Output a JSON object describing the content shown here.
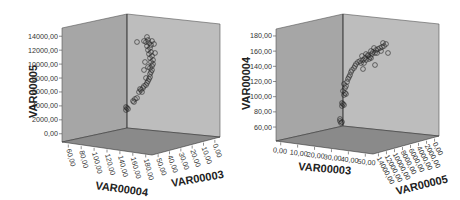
{
  "chart_data": [
    {
      "type": "scatter",
      "subtype": "3d-scatter",
      "title": "",
      "axes": {
        "vertical": {
          "label": "VAR00005",
          "ticks": [
            "0,00",
            "2000,00",
            "4000,00",
            "6000,00",
            "8000,00",
            "10000,00",
            "12000,00",
            "14000,00"
          ],
          "range": [
            0,
            14000
          ]
        },
        "left_depth": {
          "label": "VAR00004",
          "ticks": [
            "60,00",
            "80,00",
            "100,00",
            "120,00",
            "140,00",
            "160,00",
            "180,00"
          ],
          "range": [
            60,
            180
          ]
        },
        "right_depth": {
          "label": "VAR00003",
          "ticks": [
            "50,00",
            "40,00",
            "30,00",
            "20,00",
            "10,00",
            "0,00"
          ],
          "range": [
            0,
            50
          ]
        }
      },
      "grid": false,
      "legend": null,
      "points_description": "Curved band of circle markers rising from ~4000 to ~13500 on VAR00005, near the back corner",
      "points": [
        {
          "x": 126,
          "y": 110
        },
        {
          "x": 127,
          "y": 108
        },
        {
          "x": 128,
          "y": 109
        },
        {
          "x": 126,
          "y": 107
        },
        {
          "x": 133,
          "y": 101
        },
        {
          "x": 135,
          "y": 99
        },
        {
          "x": 134,
          "y": 102
        },
        {
          "x": 137,
          "y": 98
        },
        {
          "x": 139,
          "y": 92
        },
        {
          "x": 141,
          "y": 90
        },
        {
          "x": 142,
          "y": 92
        },
        {
          "x": 143,
          "y": 88
        },
        {
          "x": 144,
          "y": 86
        },
        {
          "x": 146,
          "y": 85
        },
        {
          "x": 147,
          "y": 83
        },
        {
          "x": 148,
          "y": 81
        },
        {
          "x": 149,
          "y": 79
        },
        {
          "x": 150,
          "y": 77
        },
        {
          "x": 150,
          "y": 74
        },
        {
          "x": 151,
          "y": 72
        },
        {
          "x": 152,
          "y": 70
        },
        {
          "x": 150,
          "y": 68
        },
        {
          "x": 152,
          "y": 66
        },
        {
          "x": 153,
          "y": 64
        },
        {
          "x": 151,
          "y": 62
        },
        {
          "x": 153,
          "y": 60
        },
        {
          "x": 150,
          "y": 58
        },
        {
          "x": 152,
          "y": 56
        },
        {
          "x": 149,
          "y": 54
        },
        {
          "x": 151,
          "y": 52
        },
        {
          "x": 148,
          "y": 50
        },
        {
          "x": 150,
          "y": 48
        },
        {
          "x": 147,
          "y": 46
        },
        {
          "x": 151,
          "y": 45
        },
        {
          "x": 149,
          "y": 43
        },
        {
          "x": 146,
          "y": 42
        },
        {
          "x": 152,
          "y": 41
        },
        {
          "x": 148,
          "y": 40
        },
        {
          "x": 147,
          "y": 37
        },
        {
          "x": 144,
          "y": 41
        },
        {
          "x": 137,
          "y": 42
        },
        {
          "x": 154,
          "y": 44
        },
        {
          "x": 155,
          "y": 53
        },
        {
          "x": 145,
          "y": 62
        },
        {
          "x": 144,
          "y": 70
        },
        {
          "x": 140,
          "y": 89
        },
        {
          "x": 148,
          "y": 67
        },
        {
          "x": 146,
          "y": 78
        }
      ]
    },
    {
      "type": "scatter",
      "subtype": "3d-scatter",
      "title": "",
      "axes": {
        "vertical": {
          "label": "VAR00004",
          "ticks": [
            "60,00",
            "80,00",
            "100,00",
            "120,00",
            "140,00",
            "160,00",
            "180,00"
          ],
          "range": [
            60,
            180
          ]
        },
        "left_depth": {
          "label": "VAR00003",
          "ticks": [
            "0,00",
            "10,00",
            "20,00",
            "30,00",
            "40,00",
            "50,00"
          ],
          "range": [
            0,
            50
          ]
        },
        "right_depth": {
          "label": "VAR00005",
          "ticks": [
            "14000,00",
            "12000,00",
            "10000,00",
            "8000,00",
            "6000,00",
            "4000,00",
            "2000,00",
            "0,00"
          ],
          "range": [
            0,
            14000
          ]
        }
      },
      "grid": false,
      "legend": null,
      "points_description": "Curved band of circle markers rising from ~65 to ~160 on VAR00004, near the back corner",
      "points": [
        {
          "x": 340,
          "y": 121
        },
        {
          "x": 341,
          "y": 123
        },
        {
          "x": 342,
          "y": 122
        },
        {
          "x": 340,
          "y": 119
        },
        {
          "x": 342,
          "y": 106
        },
        {
          "x": 343,
          "y": 104
        },
        {
          "x": 344,
          "y": 105
        },
        {
          "x": 342,
          "y": 103
        },
        {
          "x": 344,
          "y": 95
        },
        {
          "x": 345,
          "y": 93
        },
        {
          "x": 343,
          "y": 91
        },
        {
          "x": 346,
          "y": 94
        },
        {
          "x": 345,
          "y": 88
        },
        {
          "x": 346,
          "y": 86
        },
        {
          "x": 344,
          "y": 84
        },
        {
          "x": 347,
          "y": 82
        },
        {
          "x": 348,
          "y": 79
        },
        {
          "x": 349,
          "y": 77
        },
        {
          "x": 350,
          "y": 75
        },
        {
          "x": 351,
          "y": 72
        },
        {
          "x": 352,
          "y": 70
        },
        {
          "x": 354,
          "y": 68
        },
        {
          "x": 355,
          "y": 66
        },
        {
          "x": 356,
          "y": 64
        },
        {
          "x": 358,
          "y": 62
        },
        {
          "x": 360,
          "y": 61
        },
        {
          "x": 361,
          "y": 63
        },
        {
          "x": 363,
          "y": 60
        },
        {
          "x": 365,
          "y": 58
        },
        {
          "x": 366,
          "y": 60
        },
        {
          "x": 368,
          "y": 56
        },
        {
          "x": 370,
          "y": 57
        },
        {
          "x": 372,
          "y": 54
        },
        {
          "x": 373,
          "y": 52
        },
        {
          "x": 375,
          "y": 53
        },
        {
          "x": 376,
          "y": 50
        },
        {
          "x": 378,
          "y": 49
        },
        {
          "x": 380,
          "y": 48
        },
        {
          "x": 382,
          "y": 47
        },
        {
          "x": 384,
          "y": 46
        },
        {
          "x": 371,
          "y": 51
        },
        {
          "x": 369,
          "y": 59
        },
        {
          "x": 377,
          "y": 53
        },
        {
          "x": 381,
          "y": 51
        },
        {
          "x": 368,
          "y": 55
        },
        {
          "x": 374,
          "y": 48
        },
        {
          "x": 362,
          "y": 56
        },
        {
          "x": 366,
          "y": 54
        },
        {
          "x": 364,
          "y": 63
        },
        {
          "x": 371,
          "y": 58
        },
        {
          "x": 375,
          "y": 65
        },
        {
          "x": 363,
          "y": 69
        },
        {
          "x": 383,
          "y": 43
        },
        {
          "x": 386,
          "y": 44
        },
        {
          "x": 388,
          "y": 53
        }
      ]
    }
  ]
}
